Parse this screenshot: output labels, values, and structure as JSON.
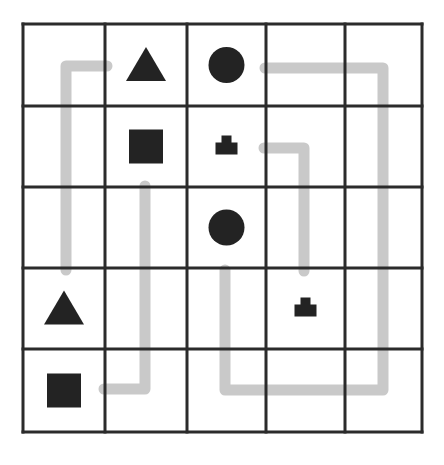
{
  "puzzle": {
    "rows": 5,
    "cols": 5,
    "x_edges": [
      23,
      105,
      187,
      266,
      345,
      422
    ],
    "y_edges": [
      24,
      106,
      187,
      268,
      349,
      432
    ],
    "colors": {
      "grid_line": "#2b2b2b",
      "shape_fill": "#232323",
      "path_stroke": "#c9c9c9",
      "background": "#ffffff"
    },
    "pieces": [
      {
        "row": 0,
        "col": 1,
        "shape": "triangle"
      },
      {
        "row": 0,
        "col": 2,
        "shape": "circle"
      },
      {
        "row": 1,
        "col": 1,
        "shape": "square"
      },
      {
        "row": 1,
        "col": 2,
        "shape": "stacked-block"
      },
      {
        "row": 2,
        "col": 2,
        "shape": "circle"
      },
      {
        "row": 3,
        "col": 0,
        "shape": "triangle"
      },
      {
        "row": 3,
        "col": 3,
        "shape": "stacked-block"
      },
      {
        "row": 4,
        "col": 0,
        "shape": "square"
      }
    ],
    "paths": [
      {
        "connects": "triangle",
        "points": "107,66 66,66 66,270"
      },
      {
        "connects": "square",
        "points": "145,186 145,389 104,389"
      },
      {
        "connects": "circle",
        "points": "265,68 383,68 383,390 225,390 225,270"
      },
      {
        "connects": "stacked-block",
        "points": "264,148 304,148 304,271"
      }
    ]
  }
}
